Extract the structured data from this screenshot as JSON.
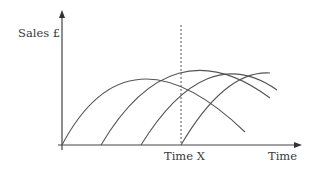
{
  "chart_data": {
    "type": "line",
    "title": "",
    "xlabel": "Time",
    "ylabel": "Sales £",
    "annotations": [
      {
        "type": "vertical-dashed-line",
        "label": "Time X"
      }
    ],
    "grid": false,
    "legend": null,
    "series": [
      {
        "name": "Product 1",
        "path": "M62,145 Q128,20 245,132"
      },
      {
        "name": "Product 2",
        "path": "M101,145 Q172,25 270,98"
      },
      {
        "name": "Product 3",
        "path": "M141,145 Q206,40 277,90"
      },
      {
        "name": "Product 4",
        "path": "M181,145 Q225,70 270,73"
      }
    ]
  },
  "labels": {
    "y_axis": "Sales £",
    "x_axis": "Time",
    "marker": "Time X"
  },
  "colors": {
    "axis": "#444444",
    "curve": "#555555"
  }
}
